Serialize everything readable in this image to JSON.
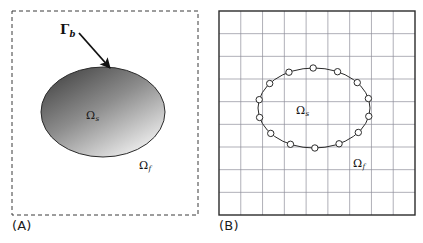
{
  "figure": {
    "width": 423,
    "height": 243,
    "background": "#ffffff"
  },
  "panels": [
    {
      "id": "A",
      "caption": "(A)",
      "description": "Continuous domain with immersed solid body",
      "frame": {
        "style": "dashed",
        "x": 12,
        "y": 11,
        "width": 186,
        "height": 204,
        "stroke": "#3a3a3a",
        "stroke_width": 1,
        "dash": "4,3"
      },
      "body": {
        "shape": "ellipse",
        "cx": 103,
        "cy": 112,
        "rx": 62,
        "ry": 45,
        "fill_type": "linear-gradient",
        "fill_from": "#4a4a4a",
        "fill_to": "#f2f2f2",
        "stroke": "#2b2b2b",
        "stroke_width": 1
      },
      "arrow": {
        "from_x": 79,
        "from_y": 33,
        "to_x": 110,
        "to_y": 68,
        "stroke": "#111111",
        "stroke_width": 1.8
      },
      "labels": [
        {
          "name": "boundary",
          "base": "Γ",
          "sub": "b"
        },
        {
          "name": "solid-domain",
          "base": "Ω",
          "sub": "s"
        },
        {
          "name": "fluid-domain",
          "base": "Ω",
          "sub": "f"
        }
      ]
    },
    {
      "id": "B",
      "caption": "(B)",
      "description": "Discretized Eulerian grid with Lagrangian boundary markers",
      "frame": {
        "style": "solid",
        "x": 8,
        "y": 11,
        "width": 196,
        "height": 204,
        "stroke": "#2b2b2b",
        "stroke_width": 1.4
      },
      "grid": {
        "columns": 9,
        "rows": 9,
        "stroke": "#8e8e9a",
        "stroke_width": 0.7
      },
      "body": {
        "shape": "ellipse",
        "cx": 103,
        "cy": 108,
        "rx": 56,
        "ry": 40,
        "fill": "none",
        "stroke": "#2b2b2b",
        "stroke_width": 1
      },
      "markers": {
        "count": 14,
        "radius": 3.2,
        "fill": "#ffffff",
        "stroke": "#2b2b2b",
        "stroke_width": 1,
        "start_angle_deg": 12
      },
      "labels": [
        {
          "name": "solid-domain",
          "base": "Ω",
          "sub": "s"
        },
        {
          "name": "fluid-domain",
          "base": "Ω",
          "sub": "f"
        }
      ]
    }
  ]
}
